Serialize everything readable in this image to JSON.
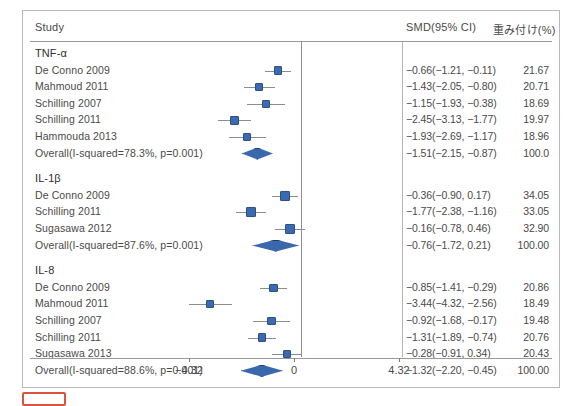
{
  "figure": {
    "header": {
      "study_label": "Study",
      "smd_label": "SMD(95% CI)",
      "weight_label": "重み付け(%)"
    },
    "axis": {
      "ticks": [
        "-4.32",
        "0",
        "4.32"
      ],
      "tick_values": [
        -4.32,
        0,
        4.32
      ],
      "min": -4.32,
      "max": 4.32
    },
    "colors": {
      "marker_fill": "#3a6bb0",
      "marker_edge": "#2d4f85",
      "diamond_fill": "#3a68ad",
      "diamond_edge": "#21386b",
      "ci_line": "#8c8c8c",
      "frame": "#b9b9b9",
      "highlight_box": "#d9543d"
    }
  },
  "chart_data": {
    "type": "forest",
    "title": "",
    "xlabel": "",
    "ylabel": "",
    "xlim": [
      -4.32,
      4.32
    ],
    "null_line": 0,
    "effect_measure": "SMD",
    "ci_level": "95%",
    "columns": [
      "Study",
      "SMD(95% CI)",
      "重み付け(%)"
    ],
    "groups": [
      {
        "name": "TNF-α",
        "rows": [
          {
            "study": "De Conno 2009",
            "est": -0.66,
            "lo": -1.21,
            "hi": -0.11,
            "weight": 21.67,
            "est_text": "−0.66(−1.21, −0.11)",
            "weight_text": "21.67"
          },
          {
            "study": "Mahmoud 2011",
            "est": -1.43,
            "lo": -2.05,
            "hi": -0.8,
            "weight": 20.71,
            "est_text": "−1.43(−2.05, −0.80)",
            "weight_text": "20.71"
          },
          {
            "study": "Schilling 2007",
            "est": -1.15,
            "lo": -1.93,
            "hi": -0.38,
            "weight": 18.69,
            "est_text": "−1.15(−1.93, −0.38)",
            "weight_text": "18.69"
          },
          {
            "study": "Schilling 2011",
            "est": -2.45,
            "lo": -3.13,
            "hi": -1.77,
            "weight": 19.97,
            "est_text": "−2.45(−3.13, −1.77)",
            "weight_text": "19.97"
          },
          {
            "study": "Hammouda 2013",
            "est": -1.93,
            "lo": -2.69,
            "hi": -1.17,
            "weight": 18.96,
            "est_text": "−1.93(−2.69, −1.17)",
            "weight_text": "18.96"
          }
        ],
        "overall": {
          "study": "Overall(I-squared=78.3%, p=0.001)",
          "i_squared": "78.3%",
          "p_value": "0.001",
          "est": -1.51,
          "lo": -2.15,
          "hi": -0.87,
          "weight": 100.0,
          "est_text": "−1.51(−2.15, −0.87)",
          "weight_text": "100.0"
        }
      },
      {
        "name": "IL-1β",
        "rows": [
          {
            "study": "De Conno 2009",
            "est": -0.36,
            "lo": -0.9,
            "hi": 0.17,
            "weight": 34.05,
            "est_text": "−0.36(−0.90, 0.17)",
            "weight_text": "34.05"
          },
          {
            "study": "Schilling 2011",
            "est": -1.77,
            "lo": -2.38,
            "hi": -1.16,
            "weight": 33.05,
            "est_text": "−1.77(−2.38, −1.16)",
            "weight_text": "33.05"
          },
          {
            "study": "Sugasawa 2012",
            "est": -0.16,
            "lo": -0.78,
            "hi": 0.46,
            "weight": 32.9,
            "est_text": "−0.16(−0.78, 0.46)",
            "weight_text": "32.90"
          }
        ],
        "overall": {
          "study": "Overall(I-squared=87.6%, p=0.001)",
          "i_squared": "87.6%",
          "p_value": "0.001",
          "est": -0.76,
          "lo": -1.72,
          "hi": 0.21,
          "weight": 100.0,
          "est_text": "−0.76(−1.72, 0.21)",
          "weight_text": "100.00"
        }
      },
      {
        "name": "IL-8",
        "rows": [
          {
            "study": "De Conno 2009",
            "est": -0.85,
            "lo": -1.41,
            "hi": -0.29,
            "weight": 20.86,
            "est_text": "−0.85(−1.41, −0.29)",
            "weight_text": "20.86"
          },
          {
            "study": "Mahmoud 2011",
            "est": -3.44,
            "lo": -4.32,
            "hi": -2.56,
            "weight": 18.49,
            "est_text": "−3.44(−4.32, −2.56)",
            "weight_text": "18.49"
          },
          {
            "study": "Schilling 2007",
            "est": -0.92,
            "lo": -1.68,
            "hi": -0.17,
            "weight": 19.48,
            "est_text": "−0.92(−1.68, −0.17)",
            "weight_text": "19.48"
          },
          {
            "study": "Schilling 2011",
            "est": -1.31,
            "lo": -1.89,
            "hi": -0.74,
            "weight": 20.76,
            "est_text": "−1.31(−1.89, −0.74)",
            "weight_text": "20.76"
          },
          {
            "study": "Sugasawa 2013",
            "est": -0.28,
            "lo": -0.91,
            "hi": 0.34,
            "weight": 20.43,
            "est_text": "−0.28(−0.91, 0.34)",
            "weight_text": "20.43"
          }
        ],
        "overall": {
          "study": "Overall(I-squared=88.6%, p=0.001)",
          "i_squared": "88.6%",
          "p_value": "0.001",
          "est": -1.32,
          "lo": -2.2,
          "hi": -0.45,
          "weight": 100.0,
          "est_text": "−1.32(−2.20, −0.45)",
          "weight_text": "100.00"
        }
      }
    ]
  }
}
